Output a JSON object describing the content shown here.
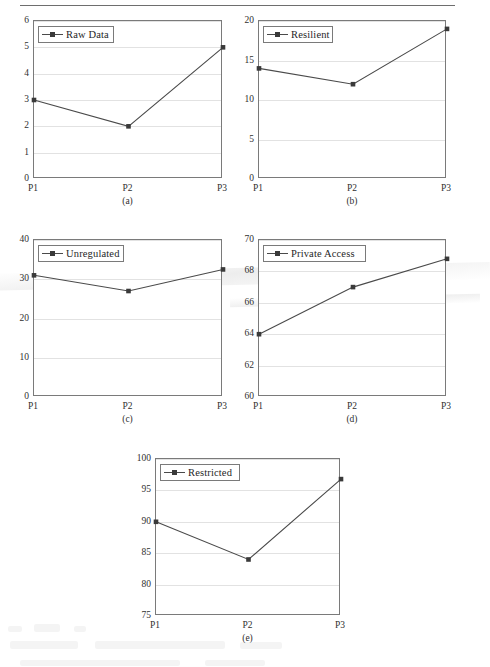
{
  "page": {
    "rule_visible": true,
    "accent": "#3a3a3a",
    "line_color": "#4a4a4a",
    "grid_color": "#e2e2e2",
    "axis_color": "#7a7a7a"
  },
  "chart_data": [
    {
      "type": "line",
      "panel": "a",
      "caption": "(a)",
      "legend": "Raw Data",
      "categories": [
        "P1",
        "P2",
        "P3"
      ],
      "values": [
        3,
        2,
        5
      ],
      "yticks": [
        0,
        1,
        2,
        3,
        4,
        5,
        6
      ],
      "ylim": [
        0,
        6
      ],
      "title": "",
      "xlabel": "",
      "ylabel": "",
      "grid": true,
      "legend_position": "top-left"
    },
    {
      "type": "line",
      "panel": "b",
      "caption": "(b)",
      "legend": "Resilient",
      "categories": [
        "P1",
        "P2",
        "P3"
      ],
      "values": [
        14,
        12,
        19
      ],
      "yticks": [
        0,
        5,
        10,
        15,
        20
      ],
      "ylim": [
        0,
        20
      ],
      "title": "",
      "xlabel": "",
      "ylabel": "",
      "grid": true,
      "legend_position": "top-left"
    },
    {
      "type": "line",
      "panel": "c",
      "caption": "(c)",
      "legend": "Unregulated",
      "categories": [
        "P1",
        "P2",
        "P3"
      ],
      "values": [
        31,
        27,
        32.5
      ],
      "yticks": [
        0,
        10,
        20,
        30,
        40
      ],
      "ylim": [
        0,
        40
      ],
      "title": "",
      "xlabel": "",
      "ylabel": "",
      "grid": true,
      "legend_position": "top-left"
    },
    {
      "type": "line",
      "panel": "d",
      "caption": "(d)",
      "legend": "Private Access",
      "categories": [
        "P1",
        "P2",
        "P3"
      ],
      "values": [
        64,
        67,
        68.8
      ],
      "yticks": [
        60,
        62,
        64,
        66,
        68,
        70
      ],
      "ylim": [
        60,
        70
      ],
      "title": "",
      "xlabel": "",
      "ylabel": "",
      "grid": true,
      "legend_position": "top-left"
    },
    {
      "type": "line",
      "panel": "e",
      "caption": "(e)",
      "legend": "Restricted",
      "categories": [
        "P1",
        "P2",
        "P3"
      ],
      "values": [
        90,
        84,
        96.8
      ],
      "yticks": [
        75,
        80,
        85,
        90,
        95,
        100
      ],
      "ylim": [
        75,
        100
      ],
      "title": "",
      "xlabel": "",
      "ylabel": "",
      "grid": true,
      "legend_position": "top-left"
    }
  ]
}
